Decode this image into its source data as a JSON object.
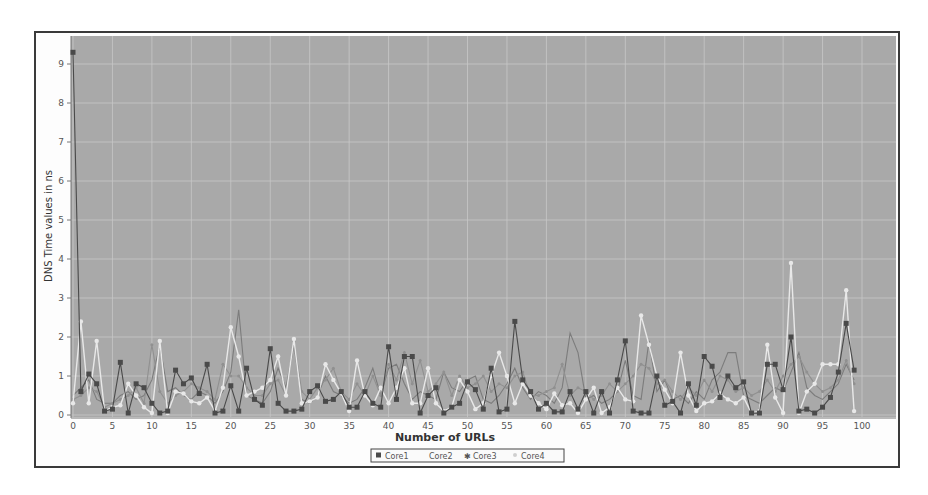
{
  "chart_data": {
    "type": "line",
    "title": "",
    "xlabel": "Number of URLs",
    "ylabel": "DNS Time values in ns",
    "xlim": [
      0,
      104
    ],
    "ylim": [
      0,
      9.7
    ],
    "x_ticks": [
      0,
      5,
      10,
      15,
      20,
      25,
      30,
      35,
      40,
      45,
      50,
      55,
      60,
      65,
      70,
      75,
      80,
      85,
      90,
      95,
      100
    ],
    "y_ticks": [
      0,
      1,
      2,
      3,
      4,
      5,
      6,
      7,
      8,
      9
    ],
    "grid": true,
    "legend_position": "bottom",
    "colors": {
      "plot_background": "#a9a9a9",
      "gridline": "#c8c8c8",
      "Core1": "#4a4a4a",
      "Core2": "#7c7c7c",
      "Core3": "#909090",
      "Core4": "#e8e8e8"
    },
    "x": [
      0,
      1,
      2,
      3,
      4,
      5,
      6,
      7,
      8,
      9,
      10,
      11,
      12,
      13,
      14,
      15,
      16,
      17,
      18,
      19,
      20,
      21,
      22,
      23,
      24,
      25,
      26,
      27,
      28,
      29,
      30,
      31,
      32,
      33,
      34,
      35,
      36,
      37,
      38,
      39,
      40,
      41,
      42,
      43,
      44,
      45,
      46,
      47,
      48,
      49,
      50,
      51,
      52,
      53,
      54,
      55,
      56,
      57,
      58,
      59,
      60,
      61,
      62,
      63,
      64,
      65,
      66,
      67,
      68,
      69,
      70,
      71,
      72,
      73,
      74,
      75,
      76,
      77,
      78,
      79,
      80,
      81,
      82,
      83,
      84,
      85,
      86,
      87,
      88,
      89,
      90,
      91,
      92,
      93,
      94,
      95,
      96,
      97,
      98,
      99
    ],
    "series": [
      {
        "name": "Core1",
        "marker": "square",
        "values": [
          9.3,
          0.6,
          1.05,
          0.8,
          0.1,
          0.15,
          1.35,
          0.05,
          0.8,
          0.7,
          0.3,
          0.05,
          0.1,
          1.15,
          0.8,
          0.95,
          0.55,
          1.3,
          0.05,
          0.1,
          0.75,
          0.1,
          1.2,
          0.4,
          0.25,
          1.7,
          0.3,
          0.1,
          0.1,
          0.15,
          0.6,
          0.75,
          0.35,
          0.4,
          0.6,
          0.2,
          0.2,
          0.6,
          0.3,
          0.2,
          1.75,
          0.4,
          1.5,
          1.5,
          0.05,
          0.5,
          0.7,
          0.05,
          0.2,
          0.3,
          0.85,
          0.65,
          0.15,
          1.2,
          0.08,
          0.15,
          2.4,
          0.9,
          0.6,
          0.15,
          0.3,
          0.08,
          0.08,
          0.6,
          0.15,
          0.6,
          0.05,
          0.6,
          0.05,
          0.9,
          1.9,
          0.1,
          0.05,
          0.05,
          1.0,
          0.25,
          0.35,
          0.05,
          0.8,
          0.25,
          1.5,
          1.25,
          0.45,
          1.0,
          0.7,
          0.85,
          0.05,
          0.05,
          1.3,
          1.3,
          0.65,
          2.0,
          0.1,
          0.15,
          0.05,
          0.2,
          0.45,
          1.1,
          2.35,
          1.15
        ]
      },
      {
        "name": "Core2",
        "marker": "none",
        "values": [
          0.5,
          0.7,
          0.9,
          0.4,
          0.3,
          0.3,
          0.5,
          0.6,
          0.4,
          0.5,
          0.9,
          1.8,
          0.6,
          0.7,
          0.5,
          0.4,
          0.6,
          0.5,
          0.3,
          0.6,
          1.1,
          2.7,
          0.5,
          0.4,
          0.3,
          0.6,
          1.2,
          0.7,
          1.8,
          0.4,
          0.3,
          0.5,
          1.0,
          0.6,
          0.5,
          0.3,
          0.4,
          0.7,
          1.2,
          0.5,
          1.2,
          1.3,
          0.8,
          0.4,
          0.6,
          0.5,
          0.4,
          1.1,
          0.7,
          0.6,
          0.9,
          1.0,
          0.4,
          0.3,
          0.5,
          0.8,
          1.2,
          0.7,
          0.4,
          0.6,
          0.5,
          0.3,
          0.7,
          2.1,
          1.6,
          0.4,
          0.5,
          0.3,
          0.4,
          0.6,
          1.4,
          0.5,
          0.4,
          1.9,
          0.6,
          0.9,
          0.4,
          0.5,
          0.3,
          0.6,
          0.4,
          0.9,
          1.1,
          1.6,
          1.6,
          0.5,
          0.4,
          0.3,
          0.5,
          0.7,
          0.6,
          1.1,
          1.6,
          0.7,
          0.5,
          0.4,
          0.6,
          0.8,
          1.3,
          0.9
        ]
      },
      {
        "name": "Core3",
        "marker": "star",
        "values": [
          0.4,
          0.5,
          0.7,
          0.6,
          0.2,
          0.3,
          0.4,
          0.5,
          0.7,
          0.3,
          1.8,
          0.6,
          0.3,
          0.5,
          0.6,
          0.8,
          0.7,
          0.6,
          0.4,
          1.3,
          1.0,
          1.0,
          0.7,
          0.5,
          0.5,
          0.8,
          0.9,
          0.5,
          1.9,
          0.6,
          0.4,
          0.7,
          0.9,
          1.2,
          0.6,
          0.4,
          0.8,
          0.5,
          1.0,
          0.5,
          1.3,
          0.9,
          1.6,
          0.8,
          1.4,
          0.6,
          0.8,
          1.1,
          0.5,
          1.0,
          0.7,
          0.8,
          1.0,
          0.6,
          0.8,
          0.7,
          1.0,
          1.1,
          0.5,
          0.5,
          0.6,
          0.7,
          1.3,
          0.5,
          0.7,
          0.6,
          0.4,
          0.5,
          0.8,
          0.6,
          0.8,
          1.0,
          1.3,
          1.2,
          0.8,
          0.9,
          0.6,
          0.4,
          0.7,
          0.5,
          0.9,
          0.6,
          1.0,
          0.9,
          0.6,
          0.7,
          0.5,
          0.6,
          0.9,
          0.6,
          1.0,
          1.3,
          1.5,
          1.1,
          0.8,
          0.6,
          0.7,
          0.9,
          1.4,
          0.8
        ]
      },
      {
        "name": "Core4",
        "marker": "circle",
        "values": [
          0.3,
          2.4,
          0.3,
          1.9,
          0.1,
          0.2,
          0.25,
          0.8,
          0.5,
          0.2,
          0.05,
          1.9,
          0.05,
          0.6,
          0.55,
          0.35,
          0.3,
          0.45,
          0.1,
          0.7,
          2.25,
          1.5,
          0.5,
          0.6,
          0.7,
          0.9,
          1.5,
          0.5,
          1.95,
          0.3,
          0.35,
          0.45,
          1.3,
          0.9,
          0.55,
          0.1,
          1.4,
          0.5,
          0.25,
          0.7,
          0.3,
          0.7,
          1.2,
          0.3,
          0.3,
          1.2,
          0.3,
          0.1,
          0.2,
          0.9,
          0.6,
          0.15,
          0.3,
          1.0,
          1.6,
          1.0,
          0.3,
          0.8,
          0.5,
          0.3,
          0.15,
          0.55,
          0.25,
          0.3,
          0.05,
          0.4,
          0.7,
          0.05,
          0.2,
          0.7,
          0.4,
          0.35,
          2.55,
          1.8,
          1.0,
          0.65,
          0.3,
          1.6,
          0.5,
          0.1,
          0.3,
          0.35,
          0.55,
          0.4,
          0.3,
          0.45,
          0.05,
          0.1,
          1.8,
          0.45,
          0.05,
          3.9,
          0.05,
          0.6,
          0.8,
          1.3,
          1.3,
          1.3,
          3.2,
          0.1
        ]
      }
    ]
  },
  "legend": {
    "items": [
      "Core1",
      "Core2",
      "Core3",
      "Core4"
    ]
  }
}
